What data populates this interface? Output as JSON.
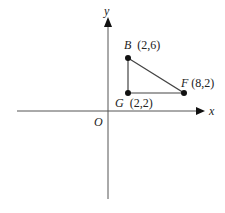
{
  "diagram": {
    "axes": {
      "x_label": "x",
      "y_label": "y",
      "origin_label": "O"
    },
    "points": [
      {
        "name": "B",
        "coords": "(2,6)",
        "x": 2,
        "y": 6
      },
      {
        "name": "F",
        "coords": "(8,2)",
        "x": 8,
        "y": 2
      },
      {
        "name": "G",
        "coords": "(2,2)",
        "x": 2,
        "y": 2
      }
    ],
    "shape": "triangle BFG",
    "colors": {
      "stroke": "#333333",
      "point": "#111111"
    }
  }
}
